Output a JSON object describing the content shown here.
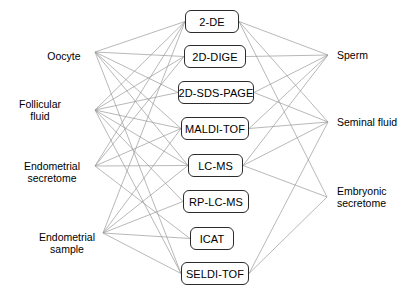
{
  "figure": {
    "type": "bipartite-network-diagram",
    "background_color": "#ffffff",
    "edge_color": "#9a9a9a",
    "box_border_color": "#2b2b2b",
    "text_color": "#000000"
  },
  "sources": [
    {
      "id": "oocyte",
      "label": "Oocyte",
      "x": 64,
      "y": 56,
      "anchor_x": 95,
      "anchor_y": 52
    },
    {
      "id": "follicular-fluid",
      "label": "Follicular\nfluid",
      "x": 40,
      "y": 110,
      "anchor_x": 95,
      "anchor_y": 110
    },
    {
      "id": "endometrial-secretome",
      "label": "Endometrial\nsecretome",
      "x": 52,
      "y": 172,
      "anchor_x": 95,
      "anchor_y": 166
    },
    {
      "id": "endometrial-sample",
      "label": "Endometrial\nsample",
      "x": 67,
      "y": 243,
      "anchor_x": 103,
      "anchor_y": 233
    }
  ],
  "techniques": [
    {
      "id": "2-de",
      "label": "2-DE",
      "x": 185,
      "y": 10,
      "w": 54,
      "h": 23
    },
    {
      "id": "2d-dige",
      "label": "2D-DIGE",
      "x": 184,
      "y": 45,
      "w": 62,
      "h": 23
    },
    {
      "id": "2d-sds-page",
      "label": "2D-SDS-PAGE",
      "x": 178,
      "y": 81,
      "w": 76,
      "h": 23
    },
    {
      "id": "maldi-tof",
      "label": "MALDI-TOF",
      "x": 181,
      "y": 117,
      "w": 68,
      "h": 23
    },
    {
      "id": "lc-ms",
      "label": "LC-MS",
      "x": 188,
      "y": 154,
      "w": 55,
      "h": 23
    },
    {
      "id": "rp-lc-ms",
      "label": "RP-LC-MS",
      "x": 183,
      "y": 190,
      "w": 66,
      "h": 23
    },
    {
      "id": "icat",
      "label": "ICAT",
      "x": 190,
      "y": 227,
      "w": 44,
      "h": 23
    },
    {
      "id": "seldi-tof",
      "label": "SELDI-TOF",
      "x": 181,
      "y": 262,
      "w": 68,
      "h": 23
    }
  ],
  "targets": [
    {
      "id": "sperm",
      "label": "Sperm",
      "x": 337,
      "y": 55,
      "anchor_x": 328,
      "anchor_y": 55
    },
    {
      "id": "seminal-fluid",
      "label": "Seminal fluid",
      "x": 337,
      "y": 122,
      "anchor_x": 328,
      "anchor_y": 122
    },
    {
      "id": "embryonic-secretome",
      "label": "Embryonic\nsecretome",
      "x": 337,
      "y": 197,
      "anchor_x": 327,
      "anchor_y": 197
    }
  ],
  "edges_left": [
    {
      "from": "oocyte",
      "to": "2-de"
    },
    {
      "from": "oocyte",
      "to": "2d-dige"
    },
    {
      "from": "oocyte",
      "to": "2d-sds-page"
    },
    {
      "from": "oocyte",
      "to": "maldi-tof"
    },
    {
      "from": "oocyte",
      "to": "lc-ms"
    },
    {
      "from": "oocyte",
      "to": "seldi-tof"
    },
    {
      "from": "follicular-fluid",
      "to": "2-de"
    },
    {
      "from": "follicular-fluid",
      "to": "2d-dige"
    },
    {
      "from": "follicular-fluid",
      "to": "2d-sds-page"
    },
    {
      "from": "follicular-fluid",
      "to": "maldi-tof"
    },
    {
      "from": "follicular-fluid",
      "to": "lc-ms"
    },
    {
      "from": "follicular-fluid",
      "to": "rp-lc-ms"
    },
    {
      "from": "follicular-fluid",
      "to": "seldi-tof"
    },
    {
      "from": "endometrial-secretome",
      "to": "2-de"
    },
    {
      "from": "endometrial-secretome",
      "to": "2d-dige"
    },
    {
      "from": "endometrial-secretome",
      "to": "maldi-tof"
    },
    {
      "from": "endometrial-secretome",
      "to": "lc-ms"
    },
    {
      "from": "endometrial-secretome",
      "to": "icat"
    },
    {
      "from": "endometrial-sample",
      "to": "2-de"
    },
    {
      "from": "endometrial-sample",
      "to": "maldi-tof"
    },
    {
      "from": "endometrial-sample",
      "to": "lc-ms"
    },
    {
      "from": "endometrial-sample",
      "to": "rp-lc-ms"
    },
    {
      "from": "endometrial-sample",
      "to": "icat"
    },
    {
      "from": "endometrial-sample",
      "to": "seldi-tof"
    }
  ],
  "edges_right": [
    {
      "from": "2-de",
      "to": "sperm"
    },
    {
      "from": "2-de",
      "to": "seminal-fluid"
    },
    {
      "from": "2-de",
      "to": "embryonic-secretome"
    },
    {
      "from": "2d-dige",
      "to": "sperm"
    },
    {
      "from": "2d-sds-page",
      "to": "sperm"
    },
    {
      "from": "2d-sds-page",
      "to": "seminal-fluid"
    },
    {
      "from": "maldi-tof",
      "to": "sperm"
    },
    {
      "from": "maldi-tof",
      "to": "seminal-fluid"
    },
    {
      "from": "lc-ms",
      "to": "sperm"
    },
    {
      "from": "lc-ms",
      "to": "seminal-fluid"
    },
    {
      "from": "lc-ms",
      "to": "embryonic-secretome"
    },
    {
      "from": "seldi-tof",
      "to": "seminal-fluid"
    },
    {
      "from": "seldi-tof",
      "to": "embryonic-secretome"
    }
  ]
}
